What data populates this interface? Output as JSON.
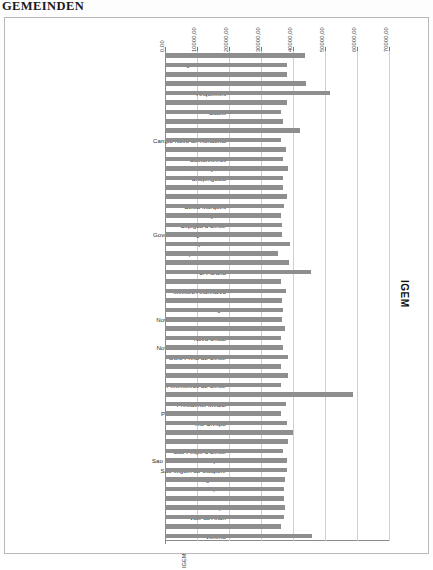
{
  "document": {
    "title": "GEMEINDEN"
  },
  "series_label": "IGEM",
  "bottom_note": "IGEM",
  "chart_data": {
    "type": "bar",
    "orientation": "horizontal",
    "title": "GEMEINDEN",
    "xlabel": "",
    "ylabel": "",
    "legend": [
      "IGEM"
    ],
    "legend_position": "right",
    "grid": true,
    "xlim": [
      0,
      70000
    ],
    "xticks": [
      0,
      10000,
      20000,
      30000,
      40000,
      50000,
      60000,
      70000
    ],
    "xtick_labels": [
      "0,00",
      "10000,00",
      "20000,00",
      "30000,00",
      "40000,00",
      "50000,00",
      "60000,00",
      "70000,00"
    ],
    "bar_color": "#8e8e8e",
    "categories": [
      "Alta Floresta d'Oeste",
      "Alto Alegre do Parecis",
      "Alto Paraiso",
      "Alvorada d'Oeste",
      "Ariquemes",
      "Buritis",
      "Cabixi",
      "Cacaulandia",
      "Cacoal",
      "Campo Novo de Rondonia",
      "Candeias do Jamari",
      "Castanheiras",
      "Cerejeiras",
      "Chupinguaia",
      "Colorado do Oeste",
      "Corumbiara",
      "Costa Marques",
      "Cujubim",
      "Espigao d'Oeste",
      "Governador Jorge Teixeira",
      "Guajara Mirim",
      "Itapua do Oeste",
      "Jaru",
      "Ji-Parana",
      "Machadinho d'Oeste",
      "Ministro Andreazza",
      "Mirante da Serra",
      "Monte Negro",
      "Nova Brasilandia d'Oeste",
      "Nova Mamore",
      "Nova Uniao",
      "Novo Horizonte do Oeste",
      "Ouro Preto do Oeste",
      "Parecis",
      "Pimenta Bueno",
      "Pimenteiras do Oeste",
      "Porto Velho",
      "Presidente Medici",
      "Primavera de Rondonia",
      "Rio Crespo",
      "Rolim de Moura",
      "Santa Luzia d'Oeste",
      "Sao Felipe d'Oeste",
      "Sao Francisco do Guapore",
      "Sao Miguel do Guapore",
      "Seringueiras",
      "Teixeiropolis",
      "Theobroma",
      "Urupa",
      "Vale do Anari",
      "Vale do Paraiso",
      "Vilhena"
    ],
    "values": [
      43800,
      38000,
      38000,
      44000,
      51500,
      38000,
      36400,
      37000,
      42100,
      36100,
      37900,
      36900,
      38300,
      36900,
      36900,
      38000,
      37200,
      36200,
      36500,
      36500,
      39200,
      35400,
      38700,
      45500,
      36100,
      37900,
      36500,
      37000,
      36600,
      37400,
      36200,
      36800,
      38500,
      36300,
      38400,
      36400,
      58700,
      37800,
      36400,
      38200,
      39900,
      38500,
      36900,
      38100,
      38200,
      37500,
      37300,
      37200,
      37400,
      37100,
      36400,
      45900
    ]
  }
}
